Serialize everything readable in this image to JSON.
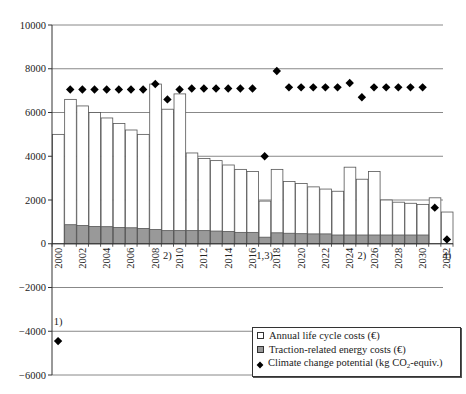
{
  "chart_data": {
    "type": "bar",
    "title": "",
    "xlabel": "",
    "ylabel": "",
    "ylim": [
      -6000,
      10000
    ],
    "yticks": [
      -6000,
      -4000,
      -2000,
      0,
      2000,
      4000,
      6000,
      8000,
      10000
    ],
    "ytick_labels": [
      "−6000",
      "−4000",
      "−2000",
      "0",
      "2000",
      "4000",
      "6000",
      "8000",
      "10000"
    ],
    "grid": true,
    "legend_position": "bottom-right",
    "categories": [
      "2000",
      "2001",
      "2002",
      "2003",
      "2004",
      "2005",
      "2006",
      "2007",
      "2008",
      "2009",
      "2010",
      "2011",
      "2012",
      "2013",
      "2014",
      "2015",
      "2016",
      "2017",
      "2018",
      "2019",
      "2020",
      "2021",
      "2022",
      "2023",
      "2024",
      "2025",
      "2026",
      "2027",
      "2028",
      "2029",
      "2030",
      "2031",
      "2032"
    ],
    "xtick_labels": [
      "2000",
      "2002",
      "2004",
      "2006",
      "2008",
      "2010",
      "2012",
      "2014",
      "2016",
      "2018",
      "2020",
      "2022",
      "2024",
      "2026",
      "2028",
      "2030",
      "2032"
    ],
    "series": [
      {
        "name": "Annual life cycle costs (€)",
        "type": "bar",
        "color": "#ffffff",
        "values": [
          5000,
          6600,
          6300,
          6000,
          5750,
          5500,
          5200,
          5000,
          7300,
          6150,
          6850,
          4150,
          3900,
          3800,
          3600,
          3400,
          3300,
          1950,
          3400,
          2850,
          2750,
          2600,
          2500,
          2400,
          3500,
          2950,
          3300,
          2000,
          1900,
          1850,
          1800,
          2100,
          1450
        ]
      },
      {
        "name": "Traction-related energy costs (€)",
        "type": "bar",
        "color": "#999999",
        "values": [
          0,
          870,
          830,
          790,
          780,
          740,
          730,
          700,
          650,
          600,
          600,
          600,
          600,
          580,
          560,
          520,
          520,
          300,
          500,
          480,
          460,
          450,
          450,
          400,
          400,
          400,
          400,
          400,
          400,
          400,
          400,
          0,
          0
        ]
      },
      {
        "name": "Climate change potential (kg CO2-equiv.)",
        "type": "scatter",
        "marker": "diamond",
        "color": "#000000",
        "values": [
          -4450,
          7050,
          7050,
          7050,
          7050,
          7050,
          7050,
          7050,
          7300,
          6600,
          7050,
          7100,
          7100,
          7100,
          7100,
          7100,
          7100,
          4000,
          7900,
          7150,
          7150,
          7150,
          7150,
          7150,
          7350,
          6700,
          7150,
          7150,
          7150,
          7150,
          7150,
          1650,
          200
        ]
      }
    ],
    "annotations": [
      {
        "text": "1)",
        "category": "2000",
        "y": -3700
      },
      {
        "text": "2)",
        "category": "2009",
        "y": -700
      },
      {
        "text": "1,3)",
        "category": "2017",
        "y": -700
      },
      {
        "text": "2)",
        "category": "2025",
        "y": -700
      },
      {
        "text": "4)",
        "category": "2032",
        "y": -700
      }
    ]
  },
  "legend": {
    "items": [
      {
        "label": "Annual life cycle costs (€)"
      },
      {
        "label": "Traction-related energy costs (€)"
      },
      {
        "label_prefix": "Climate change potential (kg CO",
        "label_sub": "2",
        "label_suffix": "-equiv.)"
      }
    ]
  }
}
